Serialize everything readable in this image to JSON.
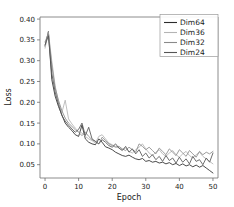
{
  "chart_data": {
    "type": "line",
    "title": "",
    "xlabel": "Epoch",
    "ylabel": "Loss",
    "xlim": [
      -1.5,
      51.5
    ],
    "ylim": [
      0.018,
      0.405
    ],
    "grid": false,
    "legend_position": "upper right",
    "xticks": [
      0,
      10,
      20,
      30,
      40,
      50
    ],
    "xtick_labels": [
      "0",
      "10",
      "20",
      "30",
      "40",
      "50"
    ],
    "yticks": [
      0.05,
      0.1,
      0.15,
      0.2,
      0.25,
      0.3,
      0.35,
      0.4
    ],
    "ytick_labels": [
      "0.05",
      "0.10",
      "0.15",
      "0.20",
      "0.25",
      "0.30",
      "0.35",
      "0.40"
    ],
    "x": [
      0,
      1,
      2,
      3,
      4,
      5,
      6,
      7,
      8,
      9,
      10,
      11,
      12,
      13,
      14,
      15,
      16,
      17,
      18,
      19,
      20,
      21,
      22,
      23,
      24,
      25,
      26,
      27,
      28,
      29,
      30,
      31,
      32,
      33,
      34,
      35,
      36,
      37,
      38,
      39,
      40,
      41,
      42,
      43,
      44,
      45,
      46,
      47,
      48,
      49,
      50
    ],
    "series": [
      {
        "name": "Dim64",
        "color": "#2b2b2b",
        "values": [
          0.335,
          0.37,
          0.255,
          0.215,
          0.19,
          0.17,
          0.15,
          0.14,
          0.132,
          0.122,
          0.118,
          0.145,
          0.112,
          0.104,
          0.1,
          0.098,
          0.112,
          0.104,
          0.093,
          0.09,
          0.086,
          0.08,
          0.076,
          0.072,
          0.07,
          0.073,
          0.068,
          0.064,
          0.062,
          0.065,
          0.058,
          0.06,
          0.056,
          0.058,
          0.054,
          0.056,
          0.052,
          0.055,
          0.05,
          0.053,
          0.048,
          0.052,
          0.047,
          0.05,
          0.045,
          0.049,
          0.044,
          0.048,
          0.042,
          0.036,
          0.03
        ]
      },
      {
        "name": "Dim36",
        "color": "#b4b4b4",
        "values": [
          0.33,
          0.368,
          0.3,
          0.24,
          0.2,
          0.175,
          0.205,
          0.16,
          0.148,
          0.138,
          0.13,
          0.126,
          0.118,
          0.112,
          0.108,
          0.102,
          0.118,
          0.122,
          0.112,
          0.102,
          0.098,
          0.094,
          0.09,
          0.086,
          0.09,
          0.082,
          0.078,
          0.086,
          0.092,
          0.1,
          0.088,
          0.078,
          0.072,
          0.08,
          0.086,
          0.076,
          0.07,
          0.078,
          0.084,
          0.074,
          0.068,
          0.076,
          0.082,
          0.072,
          0.066,
          0.074,
          0.08,
          0.07,
          0.064,
          0.058,
          0.052
        ]
      },
      {
        "name": "Dim32",
        "color": "#8a8a8a",
        "values": [
          0.345,
          0.365,
          0.29,
          0.235,
          0.205,
          0.18,
          0.162,
          0.15,
          0.142,
          0.134,
          0.128,
          0.12,
          0.128,
          0.118,
          0.11,
          0.106,
          0.1,
          0.116,
          0.108,
          0.1,
          0.096,
          0.092,
          0.094,
          0.088,
          0.084,
          0.092,
          0.086,
          0.08,
          0.1,
          0.094,
          0.086,
          0.092,
          0.084,
          0.076,
          0.09,
          0.082,
          0.074,
          0.088,
          0.08,
          0.072,
          0.086,
          0.078,
          0.07,
          0.084,
          0.076,
          0.068,
          0.082,
          0.074,
          0.08,
          0.076,
          0.082
        ]
      },
      {
        "name": "Dim24",
        "color": "#555555",
        "values": [
          0.338,
          0.36,
          0.27,
          0.225,
          0.195,
          0.168,
          0.155,
          0.145,
          0.136,
          0.128,
          0.135,
          0.15,
          0.12,
          0.14,
          0.112,
          0.106,
          0.1,
          0.11,
          0.104,
          0.096,
          0.092,
          0.1,
          0.09,
          0.084,
          0.094,
          0.08,
          0.088,
          0.076,
          0.086,
          0.07,
          0.078,
          0.066,
          0.074,
          0.062,
          0.07,
          0.058,
          0.072,
          0.06,
          0.066,
          0.054,
          0.068,
          0.056,
          0.064,
          0.052,
          0.07,
          0.058,
          0.062,
          0.05,
          0.066,
          0.056,
          0.078
        ]
      }
    ]
  },
  "legend": {
    "entries": [
      {
        "label": "Dim64"
      },
      {
        "label": "Dim36"
      },
      {
        "label": "Dim32"
      },
      {
        "label": "Dim24"
      }
    ]
  }
}
